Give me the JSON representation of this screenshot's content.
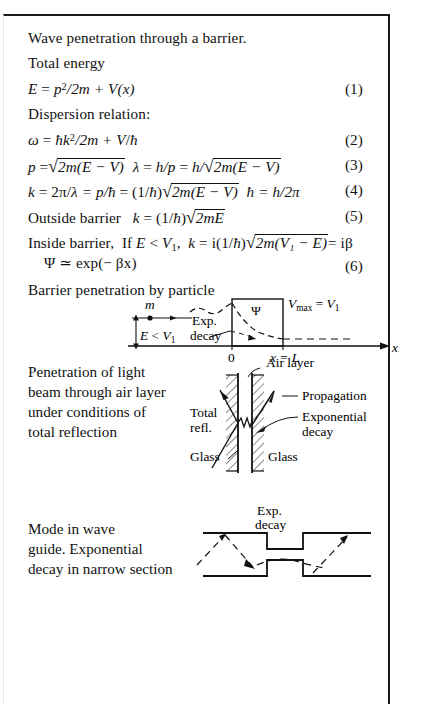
{
  "document": {
    "heading": "Wave penetration through a barrier.",
    "subheading_total_energy": "Total energy",
    "subheading_dispersion": "Dispersion relation:",
    "caption_barrier": "Barrier penetration by particle"
  },
  "equations": [
    {
      "number": "(1)",
      "text": "E = p²/2m + V(x)",
      "parts": {
        "lhs": "E",
        "eq": "=",
        "p": "p",
        "exp": "2",
        "over": "/2m +",
        "v": "V",
        "arg": "(x)"
      }
    },
    {
      "number": "(2)",
      "text": "ω = ħk²/2m + V/ħ",
      "parts": {
        "omega": "ω",
        "eq": "=",
        "hbar": "ħ",
        "k": "k",
        "exp": "2",
        "over": "/2m +",
        "v": "V",
        "slash": "/",
        "hbar2": "ħ"
      }
    },
    {
      "number": "(3)",
      "text": "p = √(2m(E − V))   λ = h/p = h/√(2m(E − V))",
      "parts": {
        "p": "p",
        "eq1": "=",
        "rad1": "2m(E − V)",
        "lambda": "λ",
        "eq2": "=",
        "hp": "h/p",
        "eq3": "=",
        "hslash": "h/",
        "rad2": "2m(E − V)"
      }
    },
    {
      "number": "(4)",
      "text": "k = 2π/λ = p/ħ = (1/ħ)√(2m(E − V))   ħ = h/2π",
      "parts": {
        "k": "k",
        "eq1": "= 2π/",
        "lambda": "λ",
        "eq2": "= p/",
        "hbar": "ħ",
        "eq3": "= (1/",
        "hbar2": "ħ",
        "close": ")",
        "rad": "2m(E − V)",
        "tail_hbar": "ħ",
        "tail": "= h/2π"
      }
    },
    {
      "number": "(5)",
      "text": "Outside barrier   k = (1/ħ)√(2mE)",
      "parts": {
        "label": "Outside barrier",
        "k": "k",
        "eq": "= (1/",
        "hbar": "ħ",
        "close": ")",
        "rad": "2mE"
      }
    },
    {
      "number": "(6)",
      "text": "Inside barrier,  If E < V₁,  k = i(1/ħ)√(2m(V₁ − E)) = iβ    Ψ ≃ exp(−βx)",
      "parts": {
        "label": "Inside barrier,",
        "cond_if": "If",
        "cond_E": "E",
        "cond_lt": "<",
        "cond_V": "V",
        "cond_sub": "1",
        "comma": ",",
        "k": "k",
        "eq": "= i(1/",
        "hbar": "ħ",
        "close": ")",
        "rad": "2m(V₁ − E)",
        "result": "= iβ",
        "psi_line": "Ψ ≃ exp(− βx)"
      }
    }
  ],
  "figures": {
    "barrier": {
      "name": "barrier-penetration-diagram",
      "labels": {
        "mass": "m",
        "energy": "E < V₁",
        "energy_E": "E",
        "energy_lt": "<",
        "energy_V": "V",
        "energy_sub": "1",
        "exp_decay_line1": "Exp.",
        "exp_decay_line2": "decay",
        "psi": "Ψ",
        "vmax": "V",
        "vmax_sub": "max",
        "vmax_eq": "=",
        "vmax_val": "V",
        "vmax_val_sub": "1",
        "origin": "0",
        "wall": "x = L",
        "axis": "x"
      }
    },
    "total_reflection": {
      "name": "total-reflection-diagram",
      "caption": "Penetration of light beam through air layer under conditions of total reflection",
      "caption_lines": [
        "Penetration of light",
        "beam through air layer",
        "under conditions of",
        "total reflection"
      ],
      "labels": {
        "air_layer": "Air layer",
        "propagation": "Propagation",
        "exponential_line1": "Exponential",
        "exponential_line2": "decay",
        "total_line1": "Total",
        "total_line2": "refl.",
        "glass_left": "Glass",
        "glass_right": "Glass"
      }
    },
    "waveguide": {
      "name": "waveguide-mode-diagram",
      "caption": "Mode in wave guide. Exponential decay in narrow section",
      "caption_lines": [
        "Mode in wave",
        "guide. Exponential",
        "decay in narrow section"
      ],
      "labels": {
        "exp_line1": "Exp.",
        "exp_line2": "decay"
      }
    }
  },
  "colors": {
    "ink": "#111111",
    "frame": "#1a1a1a",
    "paper": "#ffffff"
  }
}
